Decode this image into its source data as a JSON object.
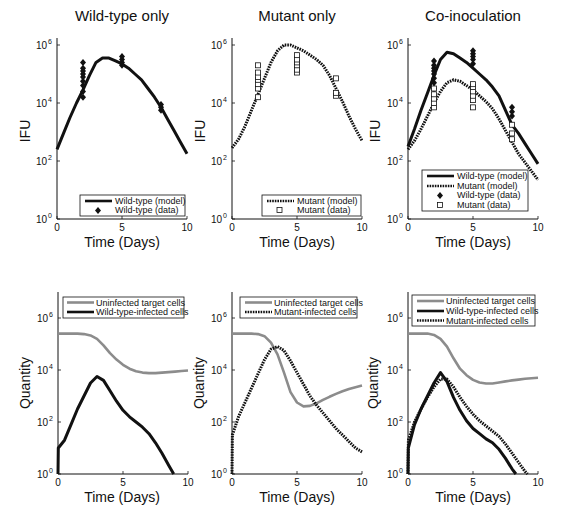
{
  "figure": {
    "rows": [
      "IFU (viral titers)",
      "Cell quantities"
    ]
  },
  "chart_data": [
    {
      "id": "wt-ifu",
      "type": "line",
      "title": "Wild-type only",
      "xlabel": "Time (Days)",
      "ylabel": "IFU",
      "yscale": "log",
      "xlim": [
        0,
        10
      ],
      "ylim": [
        1,
        1000000
      ],
      "xticks": [
        0,
        5,
        10
      ],
      "yticks_exp": [
        0,
        2,
        4,
        6
      ],
      "grid": false,
      "legend_position": "lower right",
      "series": [
        {
          "name": "Wild-type (model)",
          "style": "solid",
          "color": "#111111",
          "x": [
            0,
            0.5,
            1,
            1.5,
            2,
            2.5,
            3,
            3.5,
            4,
            4.5,
            5,
            5.5,
            6,
            6.5,
            7,
            7.5,
            8,
            8.5,
            9,
            9.5,
            10
          ],
          "log10y": [
            2.4,
            2.95,
            3.5,
            4.0,
            4.45,
            4.95,
            5.4,
            5.55,
            5.55,
            5.45,
            5.35,
            5.2,
            5.0,
            4.8,
            4.5,
            4.2,
            3.85,
            3.45,
            3.05,
            2.65,
            2.25
          ]
        },
        {
          "name": "Wild-type (data)",
          "style": "diamond",
          "color": "#111111",
          "points": [
            [
              2,
              4.2
            ],
            [
              2,
              4.4
            ],
            [
              2,
              4.6
            ],
            [
              2,
              4.75
            ],
            [
              2,
              4.9
            ],
            [
              2,
              5.0
            ],
            [
              2,
              5.1
            ],
            [
              2,
              5.2
            ],
            [
              2,
              5.4
            ],
            [
              5,
              5.3
            ],
            [
              5,
              5.4
            ],
            [
              5,
              5.5
            ],
            [
              5,
              5.6
            ],
            [
              8,
              3.75
            ],
            [
              8,
              3.85
            ],
            [
              8,
              3.95
            ]
          ]
        }
      ]
    },
    {
      "id": "mut-ifu",
      "type": "line",
      "title": "Mutant only",
      "xlabel": "Time (Days)",
      "ylabel": "IFU",
      "yscale": "log",
      "xlim": [
        0,
        10
      ],
      "ylim": [
        1,
        1000000
      ],
      "xticks": [
        0,
        5,
        10
      ],
      "yticks_exp": [
        0,
        2,
        4,
        6
      ],
      "grid": false,
      "legend_position": "lower right",
      "series": [
        {
          "name": "Mutant (model)",
          "style": "dotted",
          "color": "#111111",
          "x": [
            0,
            0.5,
            1,
            1.5,
            2,
            2.5,
            3,
            3.5,
            4,
            4.5,
            5,
            5.5,
            6,
            6.5,
            7,
            7.5,
            8,
            8.5,
            9,
            9.5,
            10
          ],
          "log10y": [
            2.45,
            2.75,
            3.2,
            3.75,
            4.3,
            4.85,
            5.4,
            5.8,
            6.0,
            6.0,
            5.9,
            5.8,
            5.65,
            5.5,
            5.3,
            4.95,
            4.5,
            4.05,
            3.55,
            3.1,
            2.7
          ]
        },
        {
          "name": "Mutant (data)",
          "style": "square",
          "color": "#111111",
          "points": [
            [
              2,
              4.2
            ],
            [
              2,
              4.5
            ],
            [
              2,
              4.65
            ],
            [
              2,
              4.8
            ],
            [
              2,
              4.9
            ],
            [
              2,
              5.05
            ],
            [
              2,
              5.3
            ],
            [
              5,
              5.05
            ],
            [
              5,
              5.15
            ],
            [
              5,
              5.3
            ],
            [
              5,
              5.4
            ],
            [
              5,
              5.5
            ],
            [
              5,
              5.65
            ],
            [
              8,
              4.25
            ],
            [
              8,
              4.35
            ],
            [
              8,
              4.85
            ]
          ]
        }
      ]
    },
    {
      "id": "coinoc-ifu",
      "type": "line",
      "title": "Co-inoculation",
      "xlabel": "Time (Days)",
      "ylabel": "IFU",
      "yscale": "log",
      "xlim": [
        0,
        10
      ],
      "ylim": [
        1,
        1000000
      ],
      "xticks": [
        0,
        5,
        10
      ],
      "yticks_exp": [
        0,
        2,
        4,
        6
      ],
      "grid": false,
      "legend_position": "lower right",
      "series": [
        {
          "name": "Wild-type (model)",
          "style": "solid",
          "color": "#111111",
          "x": [
            0,
            0.5,
            1,
            1.5,
            2,
            2.5,
            3,
            3.5,
            4,
            4.5,
            5,
            5.5,
            6,
            6.5,
            7,
            7.5,
            8,
            8.5,
            9,
            9.5,
            10
          ],
          "log10y": [
            2.5,
            3.1,
            3.75,
            4.35,
            4.95,
            5.5,
            5.75,
            5.7,
            5.55,
            5.4,
            5.2,
            5.0,
            4.8,
            4.55,
            4.25,
            3.75,
            3.25,
            2.95,
            2.6,
            2.25,
            1.9
          ]
        },
        {
          "name": "Mutant (model)",
          "style": "dotted",
          "color": "#111111",
          "x": [
            0,
            0.5,
            1,
            1.5,
            2,
            2.5,
            3,
            3.5,
            4,
            4.5,
            5,
            5.5,
            6,
            6.5,
            7,
            7.5,
            8,
            8.5,
            9,
            9.5,
            10
          ],
          "log10y": [
            2.4,
            2.7,
            3.1,
            3.55,
            4.0,
            4.4,
            4.7,
            4.8,
            4.75,
            4.6,
            4.45,
            4.25,
            4.05,
            3.8,
            3.45,
            3.05,
            2.65,
            2.25,
            1.95,
            1.65,
            1.35
          ]
        },
        {
          "name": "Wild-type (data)",
          "style": "diamond",
          "color": "#111111",
          "points": [
            [
              2,
              4.5
            ],
            [
              2,
              4.7
            ],
            [
              2,
              4.85
            ],
            [
              2,
              5.0
            ],
            [
              2,
              5.1
            ],
            [
              2,
              5.2
            ],
            [
              2,
              5.3
            ],
            [
              2,
              5.45
            ],
            [
              5,
              5.35
            ],
            [
              5,
              5.5
            ],
            [
              5,
              5.6
            ],
            [
              5,
              5.7
            ],
            [
              5,
              5.8
            ],
            [
              8,
              3.55
            ],
            [
              8,
              3.7
            ],
            [
              8,
              3.85
            ]
          ]
        },
        {
          "name": "Mutant (data)",
          "style": "square",
          "color": "#111111",
          "points": [
            [
              2,
              3.85
            ],
            [
              2,
              4.0
            ],
            [
              2,
              4.15
            ],
            [
              2,
              4.3
            ],
            [
              2,
              4.5
            ],
            [
              5,
              3.85
            ],
            [
              5,
              4.1
            ],
            [
              5,
              4.25
            ],
            [
              5,
              4.4
            ],
            [
              5,
              4.55
            ],
            [
              5,
              4.65
            ],
            [
              8,
              2.75
            ],
            [
              8,
              2.95
            ],
            [
              8,
              3.25
            ]
          ]
        }
      ]
    },
    {
      "id": "wt-cells",
      "type": "line",
      "title": "",
      "xlabel": "Time (Days)",
      "ylabel": "Quantity",
      "yscale": "log",
      "xlim": [
        0,
        10
      ],
      "ylim": [
        1,
        10000000
      ],
      "xticks": [
        0,
        5,
        10
      ],
      "yticks_exp": [
        0,
        2,
        4,
        6
      ],
      "grid": false,
      "legend_position": "upper right",
      "series": [
        {
          "name": "Uninfected target cells",
          "style": "gray",
          "color": "#8c8c8c",
          "x": [
            0,
            0.5,
            1,
            1.5,
            2,
            2.5,
            3,
            3.5,
            4,
            4.5,
            5,
            5.5,
            6,
            6.5,
            7,
            7.5,
            8,
            8.5,
            9,
            9.5,
            10
          ],
          "log10y": [
            5.4,
            5.4,
            5.4,
            5.4,
            5.38,
            5.33,
            5.2,
            4.95,
            4.65,
            4.4,
            4.2,
            4.05,
            3.95,
            3.9,
            3.88,
            3.88,
            3.9,
            3.92,
            3.94,
            3.96,
            3.98
          ]
        },
        {
          "name": "Wild-type-infected cells",
          "style": "solid",
          "color": "#111111",
          "x": [
            0,
            0.02,
            0.5,
            1,
            1.5,
            2,
            2.5,
            3,
            3.5,
            4,
            4.5,
            5,
            5.5,
            6,
            6.5,
            7,
            7.5,
            8,
            8.5,
            8.9
          ],
          "log10y": [
            0,
            1.0,
            1.3,
            1.9,
            2.5,
            3.0,
            3.5,
            3.75,
            3.6,
            3.2,
            2.8,
            2.45,
            2.2,
            2.0,
            1.8,
            1.55,
            1.2,
            0.8,
            0.35,
            0
          ]
        }
      ]
    },
    {
      "id": "mut-cells",
      "type": "line",
      "title": "",
      "xlabel": "Time (Days)",
      "ylabel": "Quantity",
      "yscale": "log",
      "xlim": [
        0,
        10
      ],
      "ylim": [
        1,
        10000000
      ],
      "xticks": [
        0,
        5,
        10
      ],
      "yticks_exp": [
        0,
        2,
        4,
        6
      ],
      "grid": false,
      "legend_position": "upper right",
      "series": [
        {
          "name": "Uninfected target cells",
          "style": "gray",
          "color": "#8c8c8c",
          "x": [
            0,
            0.5,
            1,
            1.5,
            2,
            2.5,
            3,
            3.5,
            4,
            4.5,
            5,
            5.5,
            6,
            6.5,
            7,
            7.5,
            8,
            8.5,
            9,
            9.5,
            10
          ],
          "log10y": [
            5.4,
            5.4,
            5.4,
            5.4,
            5.38,
            5.3,
            5.05,
            4.6,
            3.9,
            3.15,
            2.75,
            2.6,
            2.62,
            2.72,
            2.85,
            2.97,
            3.08,
            3.18,
            3.27,
            3.34,
            3.4
          ]
        },
        {
          "name": "Mutant-infected cells",
          "style": "dotted",
          "color": "#111111",
          "x": [
            0,
            0.03,
            0.5,
            1,
            1.5,
            2,
            2.5,
            3,
            3.5,
            4,
            4.5,
            5,
            5.5,
            6,
            6.5,
            7,
            7.5,
            8,
            8.5,
            9,
            9.5,
            10
          ],
          "log10y": [
            0,
            1.5,
            2.2,
            2.75,
            3.3,
            3.85,
            4.4,
            4.8,
            4.9,
            4.75,
            4.35,
            3.9,
            3.45,
            3.0,
            2.65,
            2.35,
            2.05,
            1.75,
            1.5,
            1.25,
            1.0,
            0.85
          ]
        }
      ]
    },
    {
      "id": "coinoc-cells",
      "type": "line",
      "title": "",
      "xlabel": "Time (Days)",
      "ylabel": "Quantity",
      "yscale": "log",
      "xlim": [
        0,
        10
      ],
      "ylim": [
        1,
        10000000
      ],
      "xticks": [
        0,
        5,
        10
      ],
      "yticks_exp": [
        0,
        2,
        4,
        6
      ],
      "grid": false,
      "legend_position": "upper right",
      "series": [
        {
          "name": "Uninfected target cells",
          "style": "gray",
          "color": "#8c8c8c",
          "x": [
            0,
            0.5,
            1,
            1.5,
            2,
            2.5,
            3,
            3.5,
            4,
            4.5,
            5,
            5.5,
            6,
            6.5,
            7,
            7.5,
            8,
            8.5,
            9,
            9.5,
            10
          ],
          "log10y": [
            5.4,
            5.4,
            5.4,
            5.4,
            5.35,
            5.2,
            4.9,
            4.45,
            4.05,
            3.8,
            3.62,
            3.52,
            3.48,
            3.48,
            3.52,
            3.56,
            3.6,
            3.63,
            3.66,
            3.68,
            3.7
          ]
        },
        {
          "name": "Wild-type-infected cells",
          "style": "solid",
          "color": "#111111",
          "x": [
            0,
            0.02,
            0.5,
            1,
            1.5,
            2,
            2.5,
            3,
            3.5,
            4,
            4.5,
            5,
            5.5,
            6,
            6.5,
            7,
            7.5,
            8,
            8.3
          ],
          "log10y": [
            0,
            1.0,
            1.9,
            2.5,
            3.0,
            3.5,
            3.9,
            3.55,
            2.95,
            2.45,
            2.05,
            1.75,
            1.55,
            1.35,
            1.2,
            0.95,
            0.6,
            0.2,
            0
          ]
        },
        {
          "name": "Mutant-infected cells",
          "style": "dotted",
          "color": "#111111",
          "x": [
            0,
            0.03,
            0.5,
            1,
            1.5,
            2,
            2.5,
            3,
            3.5,
            4,
            4.5,
            5,
            5.5,
            6,
            6.5,
            7,
            7.5,
            8,
            8.5,
            9,
            9.2
          ],
          "log10y": [
            0,
            1.3,
            2.0,
            2.5,
            2.95,
            3.35,
            3.65,
            3.65,
            3.35,
            2.95,
            2.6,
            2.3,
            2.05,
            1.85,
            1.65,
            1.45,
            1.15,
            0.8,
            0.45,
            0.1,
            0
          ]
        }
      ]
    }
  ],
  "panels": [
    {
      "title": "Wild-type only",
      "xlabel": "Time (Days)",
      "ylabel": "IFU",
      "legend": [
        "Wild-type (model)",
        "Wild-type (data)"
      ]
    },
    {
      "title": "Mutant only",
      "xlabel": "Time (Days)",
      "ylabel": "IFU",
      "legend": [
        "Mutant (model)",
        "Mutant (data)"
      ]
    },
    {
      "title": "Co-inoculation",
      "xlabel": "Time (Days)",
      "ylabel": "IFU",
      "legend": [
        "Wild-type (model)",
        "Mutant (model)",
        "Wild-type (data)",
        "Mutant (data)"
      ]
    },
    {
      "title": "",
      "xlabel": "Time (Days)",
      "ylabel": "Quantity",
      "legend": [
        "Uninfected target cells",
        "Wild-type-infected cells"
      ]
    },
    {
      "title": "",
      "xlabel": "Time (Days)",
      "ylabel": "Quantity",
      "legend": [
        "Uninfected target cells",
        "Mutant-infected cells"
      ]
    },
    {
      "title": "",
      "xlabel": "Time (Days)",
      "ylabel": "Quantity",
      "legend": [
        "Uninfected target cells",
        "Wild-type-infected cells",
        "Mutant-infected cells"
      ]
    }
  ],
  "ticks": {
    "x": [
      "0",
      "5",
      "10"
    ],
    "y_base": "10",
    "y_exp": [
      "0",
      "2",
      "4",
      "6"
    ]
  },
  "colors": {
    "ink": "#111111",
    "uninfected": "#8c8c8c",
    "background": "#ffffff"
  }
}
